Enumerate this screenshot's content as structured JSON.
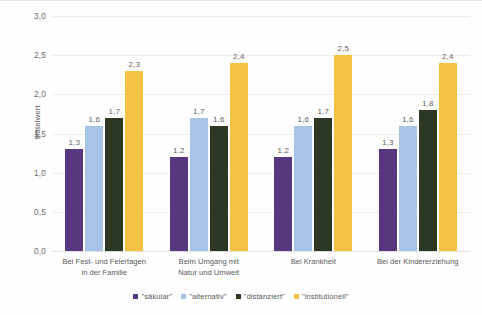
{
  "chart_data": {
    "type": "bar",
    "title": "",
    "xlabel": "",
    "ylabel": "Mittelwert",
    "ylim": [
      0,
      3
    ],
    "ytick_labels": [
      "3,0",
      "2,5",
      "2,0",
      "1,5",
      "1,0",
      "0,5",
      "0,0"
    ],
    "ytick_values": [
      3.0,
      2.5,
      2.0,
      1.5,
      1.0,
      0.5,
      0.0
    ],
    "grid": true,
    "legend_position": "bottom",
    "categories": [
      "Bei Fest- und Feiertagen in der Familie",
      "Beim Umgang mit Natur und Umwelt",
      "Bei Krankheit",
      "Bei der Kindererziehung"
    ],
    "category_lines": [
      [
        "Bei Fest- und Feiertagen",
        "in der Familie"
      ],
      [
        "Beim Umgang mit",
        "Natur und Umwelt"
      ],
      [
        "Bei Krankheit",
        ""
      ],
      [
        "Bei der Kindererziehung",
        ""
      ]
    ],
    "series": [
      {
        "name": "\"säkular\"",
        "color": "#57377D",
        "values": [
          1.3,
          1.2,
          1.2,
          1.3
        ],
        "labels": [
          "1,3",
          "1,2",
          "1,2",
          "1,3"
        ]
      },
      {
        "name": "\"alternativ\"",
        "color": "#A7C3E6",
        "values": [
          1.6,
          1.7,
          1.6,
          1.6
        ],
        "labels": [
          "1,6",
          "1,7",
          "1,6",
          "1,6"
        ]
      },
      {
        "name": "\"distanziert\"",
        "color": "#2C3823",
        "values": [
          1.7,
          1.6,
          1.7,
          1.8
        ],
        "labels": [
          "1,7",
          "1,6",
          "1,7",
          "1,8"
        ]
      },
      {
        "name": "\"institutionell\"",
        "color": "#F4C243",
        "values": [
          2.3,
          2.4,
          2.5,
          2.4
        ],
        "labels": [
          "2,3",
          "2,4",
          "2,5",
          "2,4"
        ]
      }
    ]
  }
}
